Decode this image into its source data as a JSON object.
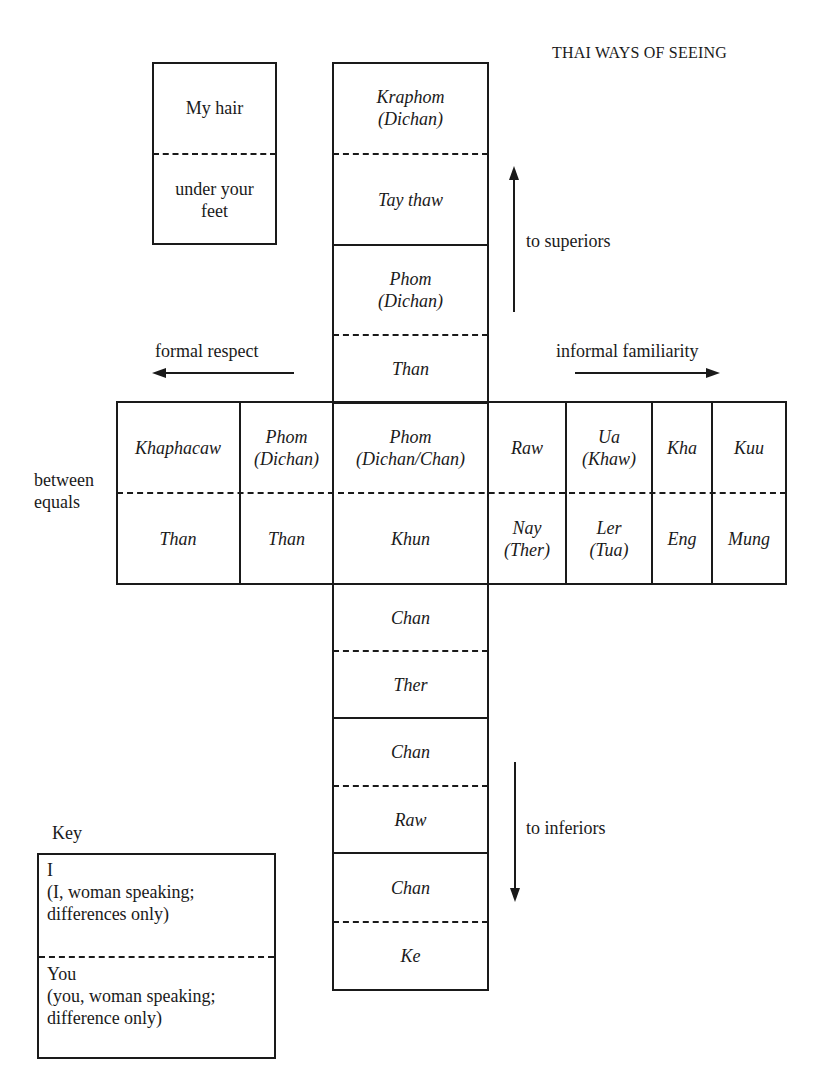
{
  "header": {
    "running_title": "THAI WAYS OF SEEING"
  },
  "example_box": {
    "top": "My hair",
    "bottom": "under your feet"
  },
  "vertical_upper": [
    {
      "i": "Kraphom",
      "i_alt": "(Dichan)",
      "you": "Tay thaw"
    },
    {
      "i": "Phom",
      "i_alt": "(Dichan)",
      "you": "Than"
    }
  ],
  "horizontal": {
    "columns": [
      {
        "i": "Khaphacaw",
        "i_alt": "",
        "you": "Than",
        "you_alt": ""
      },
      {
        "i": "Phom",
        "i_alt": "(Dichan)",
        "you": "Than",
        "you_alt": ""
      },
      {
        "i": "Phom",
        "i_alt": "(Dichan/Chan)",
        "you": "Khun",
        "you_alt": ""
      },
      {
        "i": "Raw",
        "i_alt": "",
        "you": "Nay",
        "you_alt": "(Ther)"
      },
      {
        "i": "Ua",
        "i_alt": "(Khaw)",
        "you": "Ler",
        "you_alt": "(Tua)"
      },
      {
        "i": "Kha",
        "i_alt": "",
        "you": "Eng",
        "you_alt": ""
      },
      {
        "i": "Kuu",
        "i_alt": "",
        "you": "Mung",
        "you_alt": ""
      }
    ],
    "row_label_line1": "between",
    "row_label_line2": "equals"
  },
  "vertical_lower": [
    {
      "i": "Chan",
      "you": "Ther"
    },
    {
      "i": "Chan",
      "you": "Raw"
    },
    {
      "i": "Chan",
      "you": "Ke"
    }
  ],
  "directions": {
    "up": "to superiors",
    "down": "to inferiors",
    "left": "formal respect",
    "right": "informal familiarity"
  },
  "key": {
    "title": "Key",
    "top_line1": "I",
    "top_line2": "(I, woman speaking;",
    "top_line3": "differences only)",
    "bottom_line1": "You",
    "bottom_line2": "(you, woman speaking;",
    "bottom_line3": "difference only)"
  }
}
